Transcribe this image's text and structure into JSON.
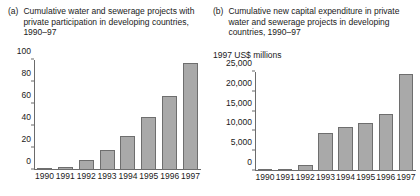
{
  "figure": {
    "panels": [
      {
        "tag": "(a)",
        "title": "Cumulative water and sewerage projects with private participation in developing countries, 1990–97",
        "axis_label": ""
      },
      {
        "tag": "(b)",
        "title": "Cumulative new capital expenditure in private water and sewerage projects in developing countries, 1990–97",
        "axis_label": "1997 US$ millions"
      }
    ]
  },
  "colors": {
    "bar_fill": "#a9a9a9",
    "bar_stroke": "#6e6e6e",
    "axis": "#6b6b6b",
    "text": "#1a1a1a",
    "background": "#ffffff"
  },
  "chart_data": [
    {
      "type": "bar",
      "panel": "(a)",
      "title": "Cumulative water and sewerage projects with private participation in developing countries, 1990–97",
      "xlabel": "",
      "ylabel": "",
      "categories": [
        "1990",
        "1991",
        "1992",
        "1993",
        "1994",
        "1995",
        "1996",
        "1997"
      ],
      "values": [
        2,
        3,
        9,
        18,
        31,
        48,
        67,
        97
      ],
      "ylim": [
        0,
        100
      ],
      "yticks": [
        0,
        20,
        40,
        60,
        80,
        100
      ],
      "ytick_labels": [
        "0",
        "20",
        "40",
        "60",
        "80",
        "100"
      ],
      "grid": false,
      "legend": false
    },
    {
      "type": "bar",
      "panel": "(b)",
      "title": "Cumulative new capital expenditure in private water and sewerage projects in developing countries, 1990–97",
      "xlabel": "",
      "ylabel": "1997 US$ millions",
      "categories": [
        "1990",
        "1991",
        "1992",
        "1993",
        "1994",
        "1995",
        "1996",
        "1997"
      ],
      "values": [
        150,
        350,
        1600,
        9500,
        11000,
        12000,
        14500,
        24500
      ],
      "ylim": [
        0,
        25000
      ],
      "yticks": [
        0,
        5000,
        10000,
        15000,
        20000,
        25000
      ],
      "ytick_labels": [
        "0",
        "5,000",
        "10,000",
        "15,000",
        "20,000",
        "25,000"
      ],
      "grid": false,
      "legend": false
    }
  ]
}
